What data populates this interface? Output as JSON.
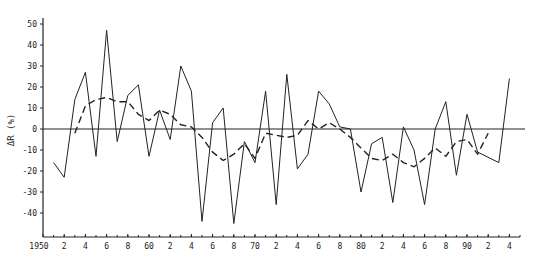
{
  "chart_data": {
    "type": "line",
    "title": "",
    "xlabel": "",
    "ylabel": "ΔR (%)",
    "xlim": [
      1950,
      1995
    ],
    "ylim": [
      -50,
      58
    ],
    "grid": false,
    "legend": null,
    "y_ticks": [
      -40,
      -30,
      -20,
      -10,
      0,
      10,
      20,
      30,
      40,
      50
    ],
    "y_tick_labels": [
      "-40",
      "-30",
      "-20",
      "-10",
      "0",
      "10",
      "20",
      "30",
      "40",
      "50"
    ],
    "x_ticks": [
      1950,
      1952,
      1954,
      1956,
      1958,
      1960,
      1962,
      1964,
      1966,
      1968,
      1970,
      1972,
      1974,
      1976,
      1978,
      1980,
      1982,
      1984,
      1986,
      1988,
      1990,
      1992,
      1994
    ],
    "x_tick_labels": [
      "1950",
      "2",
      "4",
      "6",
      "8",
      "60",
      "2",
      "4",
      "6",
      "8",
      "70",
      "2",
      "4",
      "6",
      "8",
      "80",
      "2",
      "4",
      "6",
      "8",
      "90",
      "2",
      "4"
    ],
    "reference_line": {
      "y": 0,
      "style": "solid"
    },
    "series": [
      {
        "name": "annual",
        "style": "solid",
        "x": [
          1951,
          1952,
          1953,
          1954,
          1955,
          1956,
          1957,
          1958,
          1959,
          1960,
          1961,
          1962,
          1963,
          1964,
          1965,
          1966,
          1967,
          1968,
          1969,
          1970,
          1971,
          1972,
          1973,
          1974,
          1975,
          1976,
          1977,
          1978,
          1979,
          1980,
          1981,
          1982,
          1983,
          1984,
          1985,
          1986,
          1987,
          1988,
          1989,
          1990,
          1991,
          1993,
          1994
        ],
        "values": [
          -16,
          -23,
          14,
          27,
          -13,
          47,
          -6,
          16,
          21,
          -13,
          9,
          -5,
          30,
          18,
          -44,
          3,
          10,
          -45,
          -6,
          -16,
          18,
          -36,
          26,
          -19,
          -12,
          18,
          12,
          1,
          0,
          -30,
          -7,
          -4,
          -35,
          1,
          -10,
          -36,
          0,
          13,
          -22,
          7,
          -11,
          -16,
          24
        ]
      },
      {
        "name": "smoothed",
        "style": "dashed",
        "x": [
          1953,
          1954,
          1955,
          1956,
          1957,
          1958,
          1959,
          1960,
          1961,
          1962,
          1963,
          1964,
          1965,
          1966,
          1967,
          1968,
          1969,
          1970,
          1971,
          1972,
          1973,
          1974,
          1975,
          1976,
          1977,
          1978,
          1979,
          1980,
          1981,
          1982,
          1983,
          1984,
          1985,
          1986,
          1987,
          1988,
          1989,
          1990,
          1991,
          1992
        ],
        "values": [
          -2,
          11,
          14,
          15,
          13,
          13,
          7,
          4,
          9,
          7,
          2,
          1,
          -4,
          -11,
          -15,
          -12,
          -7,
          -14,
          -2,
          -3,
          -4,
          -3,
          4,
          0,
          3,
          0,
          -4,
          -9,
          -14,
          -15,
          -12,
          -16,
          -18,
          -14,
          -9,
          -13,
          -6,
          -5,
          -12,
          -2
        ]
      }
    ]
  }
}
